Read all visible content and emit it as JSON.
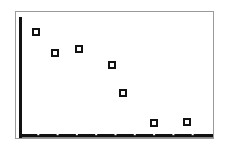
{
  "chart_data": {
    "type": "scatter",
    "title": "",
    "xlabel": "",
    "ylabel": "",
    "grid": false,
    "legend": null,
    "marker": "hollow-square",
    "x": [
      0.9,
      1.9,
      3.1,
      4.8,
      5.4,
      7.0,
      8.7
    ],
    "y": [
      8.7,
      7.0,
      7.3,
      6.0,
      3.6,
      1.1,
      1.2
    ],
    "xlim": [
      0,
      10
    ],
    "ylim": [
      0,
      10
    ],
    "x_ticks_count": 9,
    "tick_labels_visible": false,
    "pixel_points": [
      {
        "cx": 36,
        "cy": 32
      },
      {
        "cx": 55,
        "cy": 53
      },
      {
        "cx": 79,
        "cy": 49
      },
      {
        "cx": 112,
        "cy": 65
      },
      {
        "cx": 123,
        "cy": 93
      },
      {
        "cx": 154,
        "cy": 123
      },
      {
        "cx": 187,
        "cy": 122
      }
    ]
  },
  "colors": {
    "axis": "#111111",
    "marker": "#111111",
    "frame": "#9a9a9a",
    "background": "#ffffff"
  }
}
